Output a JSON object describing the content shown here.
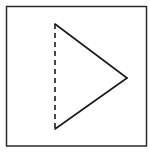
{
  "diagram": {
    "colors": {
      "background": "#ffffff",
      "stroke": "#1a1a1a",
      "frame": "#2a2a2a"
    },
    "frame": {
      "x": 6.5,
      "y": 6.5,
      "width": 140,
      "height": 139.5
    },
    "triangle": {
      "vertices": {
        "top": [
          55,
          24
        ],
        "right": [
          127,
          78
        ],
        "bottom": [
          55,
          129
        ]
      },
      "edges": [
        {
          "name": "left-edge",
          "from": "top",
          "to": "bottom",
          "style": "dashed"
        },
        {
          "name": "upper-edge",
          "from": "top",
          "to": "right",
          "style": "solid"
        },
        {
          "name": "lower-edge",
          "from": "bottom",
          "to": "right",
          "style": "solid"
        }
      ]
    }
  }
}
